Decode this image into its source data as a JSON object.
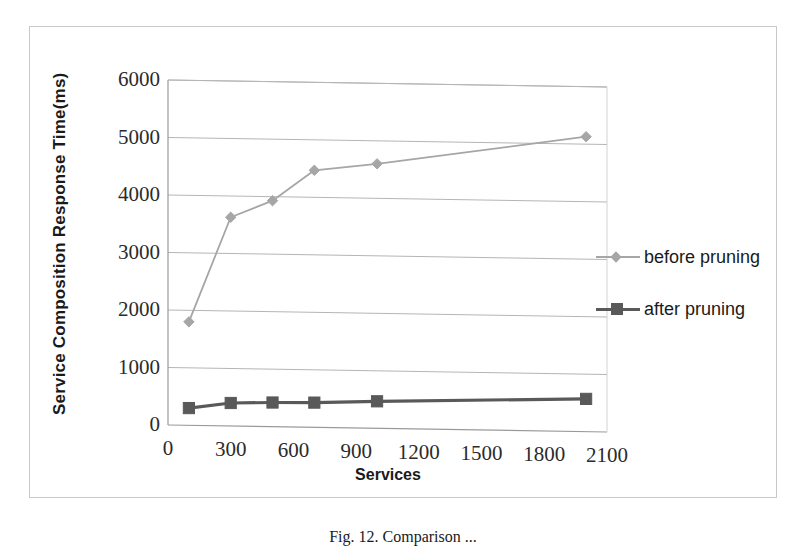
{
  "figure": {
    "caption": "Fig. 12.  Comparison ...",
    "border_color": "#c9c9c9"
  },
  "chart_data": {
    "type": "line",
    "title": "",
    "subtitle": "",
    "xlabel": "Services",
    "ylabel": "Service Composition Response Time(ms)",
    "x": [
      100,
      300,
      500,
      700,
      1000,
      2000
    ],
    "xlim": [
      0,
      2100
    ],
    "ylim": [
      0,
      6000
    ],
    "xticks": [
      0,
      300,
      600,
      900,
      1200,
      1500,
      1800,
      2100
    ],
    "xtick_labels": [
      "0",
      "300",
      "600",
      "900",
      "1200",
      "1500",
      "1800",
      "2100"
    ],
    "yticks": [
      0,
      1000,
      2000,
      3000,
      4000,
      5000,
      6000
    ],
    "ytick_labels": [
      "0",
      "1000",
      "2000",
      "3000",
      "4000",
      "5000",
      "6000"
    ],
    "grid": "horizontal",
    "legend_position": "right",
    "series": [
      {
        "name": "before pruning",
        "color": "#a6a6a6",
        "marker": "diamond",
        "values": [
          1800,
          3630,
          3930,
          4470,
          4600,
          5130
        ]
      },
      {
        "name": "after pruning",
        "color": "#595959",
        "marker": "square",
        "values": [
          300,
          400,
          420,
          430,
          470,
          570
        ]
      }
    ]
  }
}
